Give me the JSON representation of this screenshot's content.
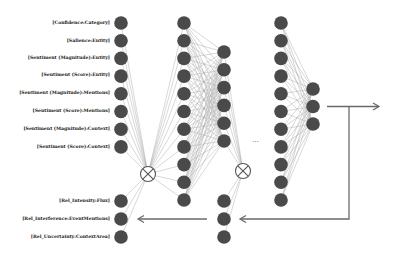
{
  "diagram": {
    "type": "neural-network",
    "input_labels_top": [
      "[Confidence:Category]",
      "[Salience:Entity]",
      "[Sentiment (Magnitude):Entity]",
      "[Sentiment (Score):Entity]",
      "[Sentiment (Magnitude):Mentions]",
      "[Sentiment (Score):Mentions]",
      "[Sentiment (Magnitude):Context]",
      "[Sentiment (Score):Context]"
    ],
    "input_labels_bottom": [
      "[Rel_Intensity:Flux]",
      "[Rel_Interference:EventMentions]",
      "[Rel_Uncertainty:ContextArea]"
    ],
    "ellipsis": "...",
    "colors": {
      "node": "#4a4a4a",
      "edge": "#9a9a9a",
      "arrow": "#6a6a6a",
      "operator": "#555555"
    }
  }
}
